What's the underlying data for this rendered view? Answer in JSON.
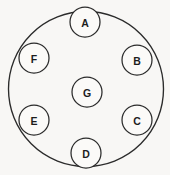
{
  "figure": {
    "title": "",
    "background_color": "#f8f7f5",
    "stroke_color": "#2b2b2b",
    "node_fill_color": "#fbfaf8",
    "label_color": "#1d1d1d"
  },
  "boundary": {
    "name": "outer-circle",
    "cx": 86,
    "cy": 89,
    "r": 77.5
  },
  "nodes": [
    {
      "id": "A",
      "label": "A",
      "cx": 85,
      "cy": 22,
      "r": 15
    },
    {
      "id": "B",
      "label": "B",
      "cx": 137,
      "cy": 60,
      "r": 15
    },
    {
      "id": "C",
      "label": "C",
      "cx": 137,
      "cy": 120,
      "r": 15
    },
    {
      "id": "D",
      "label": "D",
      "cx": 86,
      "cy": 153,
      "r": 15
    },
    {
      "id": "E",
      "label": "E",
      "cx": 34,
      "cy": 120,
      "r": 15
    },
    {
      "id": "F",
      "label": "F",
      "cx": 34,
      "cy": 58,
      "r": 15
    },
    {
      "id": "G",
      "label": "G",
      "cx": 87,
      "cy": 92,
      "r": 15
    }
  ]
}
